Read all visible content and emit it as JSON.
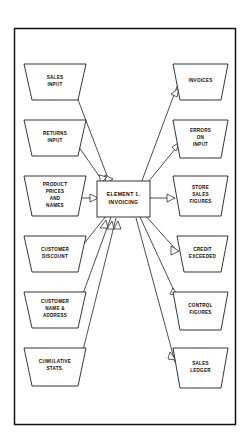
{
  "diagram": {
    "frame": {
      "name": "diagram-border"
    },
    "process": {
      "id": "element-1-invoicing",
      "label_lines": [
        "ELEMENT 1.",
        "INVOICING"
      ],
      "shape": "rectangle"
    },
    "inputs": [
      {
        "id": "sales-input",
        "label_lines": [
          "SALES",
          "INPUT"
        ]
      },
      {
        "id": "returns-input",
        "label_lines": [
          "RETURNS",
          "INPUT"
        ]
      },
      {
        "id": "product-prices-names",
        "label_lines": [
          "PRODUCT",
          "PRICES",
          "AND",
          "NAMES"
        ]
      },
      {
        "id": "customer-discount",
        "label_lines": [
          "CUSTOMER",
          "DISCOUNT"
        ]
      },
      {
        "id": "customer-name-address",
        "label_lines": [
          "CUSTOMER",
          "NAME &",
          "ADDRESS"
        ]
      },
      {
        "id": "cumulative-stats",
        "label_lines": [
          "CUMULATIVE",
          "STATS."
        ]
      }
    ],
    "outputs": [
      {
        "id": "invoices",
        "label_lines": [
          "INVOICES"
        ]
      },
      {
        "id": "errors-on-input",
        "label_lines": [
          "ERRORS",
          "ON",
          "INPUT"
        ]
      },
      {
        "id": "store-sales-figures",
        "label_lines": [
          "STORE",
          "SALES",
          "FIGURES"
        ]
      },
      {
        "id": "credit-exceeded",
        "label_lines": [
          "CREDIT",
          "EXCEEDED"
        ]
      },
      {
        "id": "control-figures",
        "label_lines": [
          "CONTROL",
          "FIGURES"
        ]
      },
      {
        "id": "sales-ledger",
        "label_lines": [
          "SALES",
          "LEDGER"
        ]
      }
    ],
    "colors": {
      "stroke": "#111111",
      "fill": "#ffffff",
      "background": "#ffffff",
      "text": "#0b0b0b"
    },
    "shape_note": "inverted trapezoid (funnel) store symbol"
  }
}
